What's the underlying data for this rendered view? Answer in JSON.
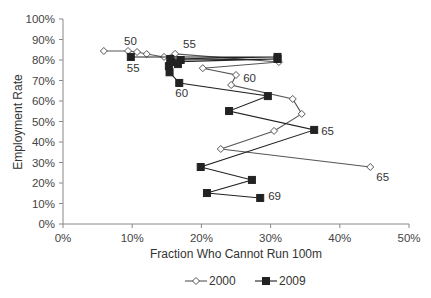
{
  "chart_data": {
    "type": "line",
    "title": "",
    "xlabel": "Fraction Who Cannot Run 100m",
    "ylabel": "Employment Rate",
    "xlim": [
      0,
      50
    ],
    "ylim": [
      0,
      100
    ],
    "x_ticks": [
      "0%",
      "10%",
      "20%",
      "30%",
      "40%",
      "50%"
    ],
    "y_ticks": [
      "0%",
      "10%",
      "20%",
      "30%",
      "40%",
      "50%",
      "60%",
      "70%",
      "80%",
      "90%",
      "100%"
    ],
    "grid": false,
    "legend_position": "bottom",
    "series": [
      {
        "name": "2000",
        "marker": "diamond-open",
        "color": "#555555",
        "points": [
          {
            "x": 5.9,
            "y": 84.4
          },
          {
            "x": 9.4,
            "y": 84.4
          },
          {
            "x": 10.7,
            "y": 83.9
          },
          {
            "x": 12.1,
            "y": 82.9
          },
          {
            "x": 14.6,
            "y": 81.5
          },
          {
            "x": 16.2,
            "y": 83.0
          },
          {
            "x": 31.2,
            "y": 79.0
          },
          {
            "x": 20.2,
            "y": 76.0
          },
          {
            "x": 25.0,
            "y": 72.7
          },
          {
            "x": 24.3,
            "y": 67.8
          },
          {
            "x": 33.2,
            "y": 61.0
          },
          {
            "x": 34.5,
            "y": 53.7
          },
          {
            "x": 30.5,
            "y": 45.4
          },
          {
            "x": 22.8,
            "y": 36.6
          },
          {
            "x": 44.4,
            "y": 27.8
          }
        ]
      },
      {
        "name": "2009",
        "marker": "square-filled",
        "color": "#222222",
        "points": [
          {
            "x": 9.8,
            "y": 81.5
          },
          {
            "x": 31.0,
            "y": 81.5
          },
          {
            "x": 15.5,
            "y": 80.5
          },
          {
            "x": 17.0,
            "y": 80.0
          },
          {
            "x": 31.0,
            "y": 80.5
          },
          {
            "x": 15.6,
            "y": 79.0
          },
          {
            "x": 16.6,
            "y": 78.0
          },
          {
            "x": 15.3,
            "y": 77.0
          },
          {
            "x": 15.4,
            "y": 74.0
          },
          {
            "x": 16.8,
            "y": 68.8
          },
          {
            "x": 29.6,
            "y": 62.4
          },
          {
            "x": 24.0,
            "y": 55.1
          },
          {
            "x": 36.3,
            "y": 45.9
          },
          {
            "x": 19.9,
            "y": 27.8
          },
          {
            "x": 27.3,
            "y": 21.5
          },
          {
            "x": 20.8,
            "y": 15.1
          },
          {
            "x": 28.5,
            "y": 12.7
          }
        ]
      }
    ],
    "annotations": [
      {
        "text": "50",
        "series": "2000",
        "x": 9.4,
        "y": 84.4
      },
      {
        "text": "55",
        "series": "2000",
        "x": 16.2,
        "y": 83.0
      },
      {
        "text": "60",
        "series": "2000",
        "x": 24.3,
        "y": 67.8
      },
      {
        "text": "65",
        "series": "2000",
        "x": 44.4,
        "y": 27.8
      },
      {
        "text": "55",
        "series": "2009",
        "x": 9.8,
        "y": 81.5
      },
      {
        "text": "60",
        "series": "2009",
        "x": 16.8,
        "y": 68.8
      },
      {
        "text": "65",
        "series": "2009",
        "x": 36.3,
        "y": 45.9
      },
      {
        "text": "69",
        "series": "2009",
        "x": 28.5,
        "y": 12.7
      }
    ]
  },
  "legend": {
    "items": [
      {
        "label": "2000",
        "marker": "diamond-open"
      },
      {
        "label": "2009",
        "marker": "square-filled"
      }
    ]
  }
}
